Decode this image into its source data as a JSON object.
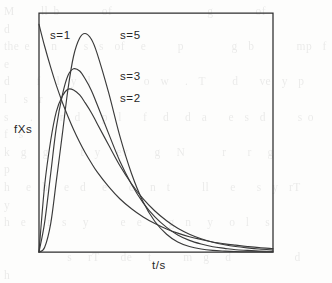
{
  "figure": {
    "kind": "scanned-figure",
    "background_color": "#fdfdfc",
    "axis_color": "#2e2e2e",
    "curve_color": "#3a3a3a",
    "plot_frame": {
      "left": 39,
      "top": 13,
      "right": 273,
      "bottom": 252
    },
    "axis_labels": {
      "y": "fXs",
      "x": "t/s"
    },
    "series_labels": [
      {
        "text": "s=1",
        "x": 50,
        "y": 39
      },
      {
        "text": "s=5",
        "x": 120,
        "y": 39
      },
      {
        "text": "s=3",
        "x": 120,
        "y": 80
      },
      {
        "text": "s=2",
        "x": 120,
        "y": 102
      }
    ],
    "bleed_text": "M     ll b        of                  g        of                    d\nthe e    n     s  s  of   e      p         g  b        mp  f  e\nd     f   l  y  l          o  w   .  T     d    ve  y  p     l   s  r\ns    .     r  d    p  l    f   d   d  a    e  s  d      s o   f  s\nk  g   g      t  y   ev     g   N       r    r   g          p\nh   e  h   e  d   e    c   n  t      ll    e    s  y  rT        y\nh  e    r  s   y      e  e     g  n   y   o  l   s\n\n            s   rT    de   t      m  g   d            d     h\n   p     r  l  n   rT   y   d   p    g  r    e   m       y    g\n   r   e   r    e  n   e  o    te   e        s   y  s       d\n   e      s    e  s  a    t  e  n  t  e     o   e   n    s\n    o      rl  d    s  t o  p  q  e  th    l   d     d      k\n    l   g      t    t  e    l    g    r    y  p   s     d  h    l\nw  l  r  t  e  f   g   t  e  o   M         r  d   t  t       h  l\n   e    n    lf  b  g  e  mt    e n    rT   e  b      g    e   d\n   n  l   l  mt   r  o  e      e  o  n        n  r     d   e  l"
  },
  "chart_data": {
    "type": "line",
    "title": "",
    "xlabel": "t/s",
    "ylabel": "fXs",
    "grid": false,
    "legend_position": "inside-plot-annotations",
    "axis_ticks": {
      "x": [],
      "y": []
    },
    "xlim": [
      0,
      4.2
    ],
    "ylim": [
      0,
      1.05
    ],
    "series": [
      {
        "name": "s=1",
        "shape_parameter": 1,
        "peak_x": 0.0,
        "peak_y": 1.0,
        "x": [
          0.0,
          0.1,
          0.21,
          0.31,
          0.42,
          0.52,
          0.62,
          0.73,
          0.83,
          0.94,
          1.04,
          1.25,
          1.45,
          1.66,
          1.87,
          2.08,
          2.29,
          2.49,
          2.7,
          2.91,
          3.12,
          3.33,
          3.53,
          3.74,
          3.95,
          4.2
        ],
        "y": [
          1.0,
          0.905,
          0.811,
          0.733,
          0.657,
          0.595,
          0.538,
          0.482,
          0.436,
          0.391,
          0.353,
          0.287,
          0.234,
          0.19,
          0.154,
          0.125,
          0.101,
          0.083,
          0.067,
          0.055,
          0.044,
          0.036,
          0.03,
          0.024,
          0.019,
          0.015
        ]
      },
      {
        "name": "s=2",
        "shape_parameter": 2,
        "peak_x": 0.52,
        "peak_y": 0.715,
        "x": [
          0.0,
          0.1,
          0.21,
          0.31,
          0.42,
          0.52,
          0.62,
          0.73,
          0.83,
          0.94,
          1.04,
          1.25,
          1.45,
          1.66,
          1.87,
          2.08,
          2.29,
          2.49,
          2.7,
          2.91,
          3.12,
          3.33,
          3.53,
          3.74,
          3.95,
          4.2
        ],
        "y": [
          0.0,
          0.29,
          0.49,
          0.616,
          0.685,
          0.715,
          0.712,
          0.69,
          0.655,
          0.612,
          0.566,
          0.47,
          0.38,
          0.3,
          0.233,
          0.18,
          0.137,
          0.104,
          0.078,
          0.058,
          0.043,
          0.032,
          0.024,
          0.018,
          0.013,
          0.009
        ]
      },
      {
        "name": "s=3",
        "shape_parameter": 3,
        "peak_x": 0.64,
        "peak_y": 0.805,
        "x": [
          0.0,
          0.1,
          0.21,
          0.31,
          0.42,
          0.52,
          0.62,
          0.73,
          0.83,
          0.94,
          1.04,
          1.25,
          1.45,
          1.66,
          1.87,
          2.08,
          2.29,
          2.49,
          2.7,
          2.91,
          3.12,
          3.33,
          3.53,
          3.74,
          3.95,
          4.2
        ],
        "y": [
          0.0,
          0.128,
          0.345,
          0.545,
          0.69,
          0.775,
          0.805,
          0.795,
          0.76,
          0.71,
          0.65,
          0.52,
          0.4,
          0.298,
          0.216,
          0.154,
          0.108,
          0.075,
          0.051,
          0.035,
          0.023,
          0.016,
          0.01,
          0.007,
          0.004,
          0.003
        ]
      },
      {
        "name": "s=5",
        "shape_parameter": 5,
        "peak_x": 0.8,
        "peak_y": 0.96,
        "x": [
          0.0,
          0.1,
          0.21,
          0.31,
          0.42,
          0.52,
          0.62,
          0.73,
          0.83,
          0.94,
          1.04,
          1.25,
          1.45,
          1.66,
          1.87,
          2.08,
          2.29,
          2.49,
          2.7,
          2.91,
          3.12,
          3.33,
          3.53,
          3.74,
          3.95,
          4.2
        ],
        "y": [
          0.0,
          0.02,
          0.125,
          0.31,
          0.52,
          0.715,
          0.86,
          0.94,
          0.96,
          0.935,
          0.875,
          0.7,
          0.51,
          0.345,
          0.22,
          0.134,
          0.078,
          0.044,
          0.024,
          0.013,
          0.007,
          0.004,
          0.002,
          0.001,
          0.001,
          0.0
        ]
      }
    ]
  }
}
